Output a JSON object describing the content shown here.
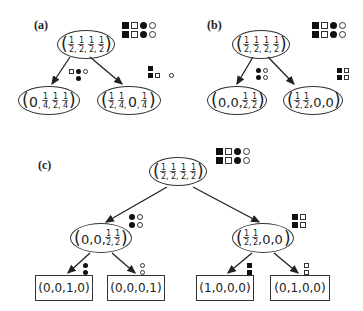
{
  "panels": {
    "a": {
      "label": "(a)",
      "root": {
        "value": "(1/2, 1/2, 1/2, 1/2)",
        "symbols": [
          [
            "filled-square",
            "empty-square",
            "filled-circle",
            "empty-circle"
          ],
          [
            "filled-square",
            "empty-square",
            "filled-circle",
            "empty-circle"
          ]
        ]
      },
      "children": [
        {
          "value": "(0, 1/4, 1/2, 1/4)",
          "edge_symbols": [
            [
              "empty-square",
              "filled-circle",
              "empty-circle"
            ],
            [
              "filled-circle"
            ]
          ]
        },
        {
          "value": "(1/2, 1/4, 0, 1/4)",
          "edge_symbols": [
            [
              "filled-square"
            ],
            [
              "filled-square",
              "empty-square",
              "empty-circle"
            ]
          ]
        }
      ]
    },
    "b": {
      "label": "(b)",
      "root": {
        "value": "(1/2, 1/2, 1/2, 1/2)",
        "symbols": [
          [
            "filled-square",
            "empty-square",
            "filled-circle",
            "empty-circle"
          ],
          [
            "filled-square",
            "empty-square",
            "filled-circle",
            "empty-circle"
          ]
        ]
      },
      "children": [
        {
          "value": "(0, 0, 1/2, 1/2)",
          "edge_symbols": [
            [
              "filled-circle",
              "empty-circle"
            ],
            [
              "filled-circle",
              "empty-circle"
            ]
          ]
        },
        {
          "value": "(1/2, 1/2, 0, 0)",
          "edge_symbols": [
            [
              "filled-square",
              "empty-square"
            ],
            [
              "filled-square",
              "empty-square"
            ]
          ]
        }
      ]
    },
    "c": {
      "label": "(c)",
      "root": {
        "value": "(1/2, 1/2, 1/2, 1/2)",
        "symbols": [
          [
            "filled-square",
            "empty-square",
            "filled-circle",
            "empty-circle"
          ],
          [
            "filled-square",
            "empty-square",
            "filled-circle",
            "empty-circle"
          ]
        ]
      },
      "children": [
        {
          "value": "(0, 0, 1/2, 1/2)",
          "edge_symbols": [
            [
              "filled-circle",
              "empty-circle"
            ],
            [
              "filled-circle",
              "empty-circle"
            ]
          ],
          "leaves": [
            {
              "value": "(0,0,1,0)",
              "edge_symbols": [
                [
                  "filled-circle"
                ],
                [
                  "filled-circle"
                ]
              ]
            },
            {
              "value": "(0,0,0,1)",
              "edge_symbols": [
                [
                  "empty-circle"
                ],
                [
                  "empty-circle"
                ]
              ]
            }
          ]
        },
        {
          "value": "(1/2, 1/2, 0, 0)",
          "edge_symbols": [
            [
              "filled-square",
              "empty-square"
            ],
            [
              "filled-square",
              "empty-square"
            ]
          ],
          "leaves": [
            {
              "value": "(1,0,0,0)",
              "edge_symbols": [
                [
                  "filled-square"
                ],
                [
                  "filled-square"
                ]
              ]
            },
            {
              "value": "(0,1,0,0)",
              "edge_symbols": [
                [
                  "empty-square"
                ],
                [
                  "empty-square"
                ]
              ]
            }
          ]
        }
      ]
    }
  },
  "text": {
    "a_label": "(a)",
    "b_label": "(b)",
    "c_label": "(c)",
    "leaf_c1": "(0,0,1,0)",
    "leaf_c2": "(0,0,0,1)",
    "leaf_c3": "(1,0,0,0)",
    "leaf_c4": "(0,1,0,0)"
  }
}
